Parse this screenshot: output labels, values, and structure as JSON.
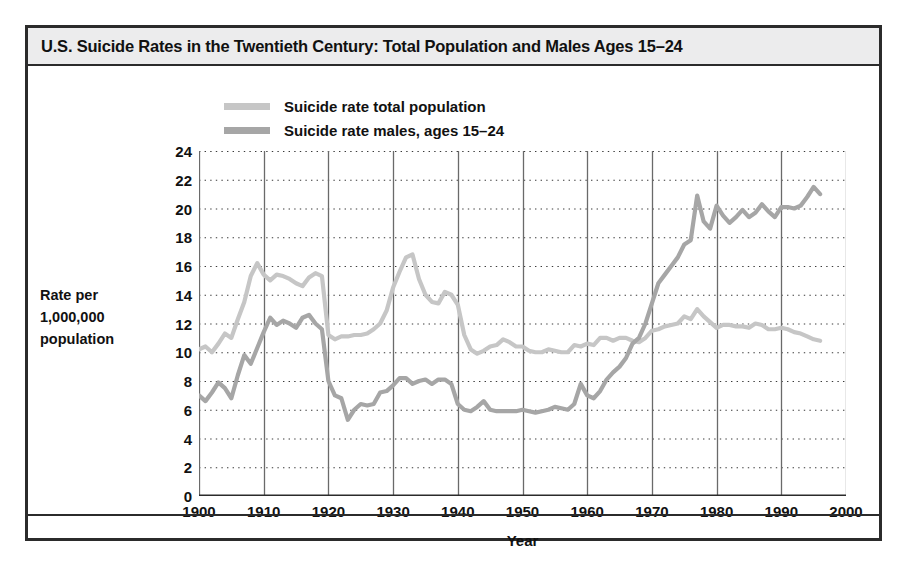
{
  "figure": {
    "title": "U.S. Suicide Rates in the Twentieth Century: Total Population and Males Ages 15–24"
  },
  "chart_data": {
    "type": "line",
    "title": "U.S. Suicide Rates in the Twentieth Century: Total Population and Males Ages 15–24",
    "xlabel": "Year",
    "ylabel": "Rate per 1,000,000 population",
    "ylabel_lines": [
      "Rate per",
      "1,000,000",
      "population"
    ],
    "xlim": [
      1900,
      2000
    ],
    "ylim": [
      0,
      24
    ],
    "xticks": [
      1900,
      1910,
      1920,
      1930,
      1940,
      1950,
      1960,
      1970,
      1980,
      1990,
      2000
    ],
    "yticks": [
      0,
      2,
      4,
      6,
      8,
      10,
      12,
      14,
      16,
      18,
      20,
      22,
      24
    ],
    "grid": {
      "horizontal": "dotted",
      "vertical": "solid"
    },
    "legend_position": "top-left-inside",
    "colors": {
      "total_population": "#c6c6c6",
      "males_15_24": "#a6a6a6",
      "axis": "#555555",
      "text": "#111111"
    },
    "series": [
      {
        "name": "Suicide rate total population",
        "color": "#c6c6c6",
        "x": [
          1900,
          1901,
          1902,
          1903,
          1904,
          1905,
          1906,
          1907,
          1908,
          1909,
          1910,
          1911,
          1912,
          1913,
          1914,
          1915,
          1916,
          1917,
          1918,
          1919,
          1920,
          1921,
          1922,
          1923,
          1924,
          1925,
          1926,
          1927,
          1928,
          1929,
          1930,
          1931,
          1932,
          1933,
          1934,
          1935,
          1936,
          1937,
          1938,
          1939,
          1940,
          1941,
          1942,
          1943,
          1944,
          1945,
          1946,
          1947,
          1948,
          1949,
          1950,
          1951,
          1952,
          1953,
          1954,
          1955,
          1956,
          1957,
          1958,
          1959,
          1960,
          1961,
          1962,
          1963,
          1964,
          1965,
          1966,
          1967,
          1968,
          1969,
          1970,
          1971,
          1972,
          1973,
          1974,
          1975,
          1976,
          1977,
          1978,
          1979,
          1980,
          1981,
          1982,
          1983,
          1984,
          1985,
          1986,
          1987,
          1988,
          1989,
          1990,
          1991,
          1992,
          1993,
          1994,
          1995,
          1996
        ],
        "values": [
          10.2,
          10.4,
          10.0,
          10.6,
          11.3,
          11.0,
          12.3,
          13.5,
          15.3,
          16.2,
          15.4,
          15.0,
          15.4,
          15.3,
          15.1,
          14.8,
          14.6,
          15.2,
          15.5,
          15.3,
          11.2,
          10.9,
          11.1,
          11.1,
          11.2,
          11.2,
          11.3,
          11.6,
          12.0,
          12.9,
          14.5,
          15.6,
          16.6,
          16.8,
          15.1,
          14.0,
          13.5,
          13.4,
          14.2,
          14.0,
          13.3,
          11.2,
          10.2,
          9.9,
          10.1,
          10.4,
          10.5,
          10.9,
          10.7,
          10.4,
          10.4,
          10.1,
          10.0,
          10.0,
          10.2,
          10.1,
          10.0,
          10.0,
          10.5,
          10.4,
          10.6,
          10.5,
          11.0,
          11.0,
          10.8,
          11.0,
          11.0,
          10.8,
          10.7,
          11.0,
          11.5,
          11.6,
          11.8,
          11.9,
          12.0,
          12.5,
          12.3,
          13.0,
          12.5,
          12.1,
          11.7,
          11.9,
          11.9,
          11.8,
          11.8,
          11.7,
          12.0,
          11.9,
          11.6,
          11.6,
          11.7,
          11.6,
          11.4,
          11.3,
          11.1,
          10.9,
          10.8
        ]
      },
      {
        "name": "Suicide rate males, ages 15–24",
        "color": "#a6a6a6",
        "x": [
          1900,
          1901,
          1902,
          1903,
          1904,
          1905,
          1906,
          1907,
          1908,
          1909,
          1910,
          1911,
          1912,
          1913,
          1914,
          1915,
          1916,
          1917,
          1918,
          1919,
          1920,
          1921,
          1922,
          1923,
          1924,
          1925,
          1926,
          1927,
          1928,
          1929,
          1930,
          1931,
          1932,
          1933,
          1934,
          1935,
          1936,
          1937,
          1938,
          1939,
          1940,
          1941,
          1942,
          1943,
          1944,
          1945,
          1946,
          1947,
          1948,
          1949,
          1950,
          1951,
          1952,
          1953,
          1954,
          1955,
          1956,
          1957,
          1958,
          1959,
          1960,
          1961,
          1962,
          1963,
          1964,
          1965,
          1966,
          1967,
          1968,
          1969,
          1970,
          1971,
          1972,
          1973,
          1974,
          1975,
          1976,
          1977,
          1978,
          1979,
          1980,
          1981,
          1982,
          1983,
          1984,
          1985,
          1986,
          1987,
          1988,
          1989,
          1990,
          1991,
          1992,
          1993,
          1994,
          1995,
          1996
        ],
        "values": [
          7.0,
          6.6,
          7.2,
          7.9,
          7.5,
          6.8,
          8.4,
          9.8,
          9.2,
          10.3,
          11.4,
          12.4,
          11.9,
          12.2,
          12.0,
          11.7,
          12.4,
          12.6,
          12.0,
          11.6,
          8.0,
          7.0,
          6.8,
          5.3,
          6.0,
          6.4,
          6.3,
          6.4,
          7.2,
          7.3,
          7.7,
          8.2,
          8.2,
          7.8,
          8.0,
          8.1,
          7.8,
          8.1,
          8.1,
          7.8,
          6.4,
          6.0,
          5.9,
          6.2,
          6.6,
          6.0,
          5.9,
          5.9,
          5.9,
          5.9,
          6.0,
          5.9,
          5.8,
          5.9,
          6.0,
          6.2,
          6.1,
          6.0,
          6.4,
          7.8,
          7.0,
          6.8,
          7.3,
          8.1,
          8.6,
          9.0,
          9.6,
          10.6,
          11.0,
          12.0,
          13.4,
          14.8,
          15.4,
          16.0,
          16.6,
          17.5,
          17.8,
          20.9,
          19.1,
          18.6,
          20.2,
          19.5,
          19.0,
          19.4,
          19.9,
          19.4,
          19.7,
          20.3,
          19.8,
          19.4,
          20.1,
          20.1,
          20.0,
          20.2,
          20.8,
          21.5,
          21.0
        ]
      }
    ]
  },
  "legend": {
    "items": [
      {
        "label": "Suicide rate total population",
        "color": "#c6c6c6"
      },
      {
        "label": "Suicide rate males, ages 15–24",
        "color": "#a6a6a6"
      }
    ]
  }
}
